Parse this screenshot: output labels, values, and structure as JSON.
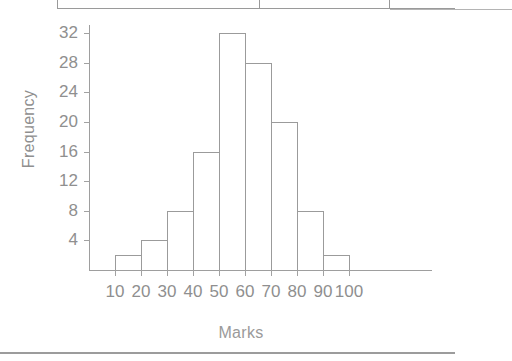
{
  "figure": {
    "ylabel": "Frequency",
    "xlabel": "Marks",
    "axis_color": "#9e9e9e",
    "bar_border_color": "#9b9b9b",
    "bar_fill": "transparent",
    "text_color": "#8f8f8f"
  },
  "chart_data": {
    "type": "bar",
    "title": "",
    "subtitle": "",
    "xlabel": "Marks",
    "ylabel": "Frequency",
    "grid": false,
    "legend": null,
    "legend_position": null,
    "bin_width": 10,
    "bin_edges": [
      10,
      20,
      30,
      40,
      50,
      60,
      70,
      80,
      90,
      100
    ],
    "categories": [
      "10-20",
      "20-30",
      "30-40",
      "40-50",
      "50-60",
      "60-70",
      "70-80",
      "80-90",
      "90-100"
    ],
    "values": [
      2,
      4,
      8,
      16,
      32,
      28,
      20,
      8,
      2
    ],
    "xlim": [
      10,
      100
    ],
    "ylim": [
      0,
      32
    ],
    "xticks": [
      10,
      20,
      30,
      40,
      50,
      60,
      70,
      80,
      90,
      100
    ],
    "xtick_labels": [
      "10",
      "20",
      "30",
      "40",
      "50",
      "60",
      "70",
      "80",
      "90",
      "100"
    ],
    "yticks": [
      4,
      8,
      12,
      16,
      20,
      24,
      28,
      32
    ],
    "ytick_labels": [
      "4",
      "8",
      "12",
      "16",
      "20",
      "24",
      "28",
      "32"
    ],
    "total_frequency": 120,
    "annotations": []
  },
  "table_fragment": {
    "note": "cropped table border above figure"
  }
}
